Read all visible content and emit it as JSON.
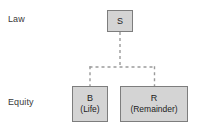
{
  "diagram": {
    "rows": [
      {
        "id": "law",
        "label": "Law"
      },
      {
        "id": "equity",
        "label": "Equity"
      }
    ],
    "nodes": [
      {
        "id": "s",
        "title": "S",
        "subtitle": "",
        "row": "law",
        "x": 107,
        "y": 10,
        "width": 26,
        "height": 22
      },
      {
        "id": "b",
        "title": "B",
        "subtitle": "(Life)",
        "row": "equity",
        "x": 72,
        "y": 86,
        "width": 36,
        "height": 36
      },
      {
        "id": "r",
        "title": "R",
        "subtitle": "(Remainder)",
        "row": "equity",
        "x": 120,
        "y": 86,
        "width": 68,
        "height": 36
      }
    ],
    "edges": [
      {
        "id": "s-to-junction",
        "from": "s",
        "to": "junction",
        "style": "dashed"
      },
      {
        "id": "junction-to-b",
        "from": "junction",
        "to": "b",
        "style": "dashed"
      },
      {
        "id": "junction-to-r",
        "from": "junction",
        "to": "r",
        "style": "dashed"
      }
    ],
    "colors": {
      "node_fill": "#d4d4d4",
      "node_border": "#7d7d7d",
      "connector": "#9a9a9a",
      "text": "#1c1c1c",
      "label_text": "#3a3a3a",
      "background": "#ffffff"
    }
  }
}
